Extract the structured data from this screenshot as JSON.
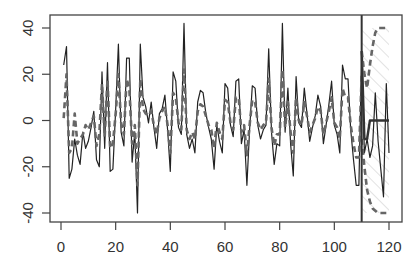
{
  "chart_data": {
    "type": "line",
    "title": "",
    "xlabel": "",
    "ylabel": "",
    "xlim": [
      -3,
      125
    ],
    "ylim": [
      -44,
      46
    ],
    "grid": false,
    "legend": null,
    "x_ticks": [
      0,
      20,
      40,
      60,
      80,
      100,
      120
    ],
    "y_ticks": [
      -40,
      -20,
      0,
      20,
      40
    ],
    "x_tick_labels": [
      "0",
      "20",
      "40",
      "60",
      "80",
      "100",
      "120"
    ],
    "y_tick_labels": [
      "-40",
      "-20",
      "0",
      "20",
      "40"
    ],
    "forecast_start": 110,
    "series": [
      {
        "name": "observed",
        "style": "solid",
        "color": "#222222",
        "x": [
          1,
          2,
          3,
          4,
          5,
          6,
          7,
          8,
          9,
          10,
          11,
          12,
          13,
          14,
          15,
          16,
          17,
          18,
          19,
          20,
          21,
          22,
          23,
          24,
          25,
          26,
          27,
          28,
          29,
          30,
          31,
          32,
          33,
          34,
          35,
          36,
          37,
          38,
          39,
          40,
          41,
          42,
          43,
          44,
          45,
          46,
          47,
          48,
          49,
          50,
          51,
          52,
          53,
          54,
          55,
          56,
          57,
          58,
          59,
          60,
          61,
          62,
          63,
          64,
          65,
          66,
          67,
          68,
          69,
          70,
          71,
          72,
          73,
          74,
          75,
          76,
          77,
          78,
          79,
          80,
          81,
          82,
          83,
          84,
          85,
          86,
          87,
          88,
          89,
          90,
          91,
          92,
          93,
          94,
          95,
          96,
          97,
          98,
          99,
          100,
          101,
          102,
          103,
          104,
          105,
          106,
          107,
          108,
          109,
          110,
          111,
          112,
          113,
          114,
          115,
          116,
          117,
          118,
          119,
          120
        ],
        "values": [
          24,
          32,
          -25,
          -21,
          -8,
          -15,
          -19,
          -5,
          -12,
          -9,
          -3,
          4,
          -17,
          -20,
          21,
          -12,
          25,
          -22,
          -21,
          5,
          33,
          -5,
          -11,
          27,
          27,
          -18,
          -5,
          -40,
          33,
          10,
          6,
          -1,
          8,
          -3,
          -12,
          3,
          5,
          11,
          -4,
          -22,
          21,
          17,
          -3,
          -6,
          42,
          -6,
          -12,
          -8,
          -14,
          8,
          13,
          12,
          3,
          -3,
          -8,
          -21,
          -2,
          -9,
          -14,
          16,
          14,
          -2,
          -7,
          17,
          18,
          -10,
          -4,
          -28,
          -4,
          15,
          14,
          -2,
          -8,
          -4,
          -2,
          31,
          -5,
          -19,
          -10,
          -11,
          42,
          -5,
          14,
          -10,
          -24,
          19,
          -1,
          -3,
          14,
          3,
          -9,
          -3,
          2,
          11,
          6,
          -10,
          -2,
          7,
          17,
          -2,
          -6,
          -14,
          24,
          18,
          18,
          -4,
          -17,
          -28,
          -28,
          30,
          -14,
          -8,
          -16,
          -11,
          12,
          -9,
          -21,
          -33,
          16,
          -14
        ]
      },
      {
        "name": "fitted",
        "style": "dashed",
        "color": "#666666",
        "x": [
          1,
          2,
          3,
          4,
          5,
          6,
          7,
          8,
          9,
          10,
          11,
          12,
          13,
          14,
          15,
          16,
          17,
          18,
          19,
          20,
          21,
          22,
          23,
          24,
          25,
          26,
          27,
          28,
          29,
          30,
          31,
          32,
          33,
          34,
          35,
          36,
          37,
          38,
          39,
          40,
          41,
          42,
          43,
          44,
          45,
          46,
          47,
          48,
          49,
          50,
          51,
          52,
          53,
          54,
          55,
          56,
          57,
          58,
          59,
          60,
          61,
          62,
          63,
          64,
          65,
          66,
          67,
          68,
          69,
          70,
          71,
          72,
          73,
          74,
          75,
          76,
          77,
          78,
          79,
          80,
          81,
          82,
          83,
          84,
          85,
          86,
          87,
          88,
          89,
          90,
          91,
          92,
          93,
          94,
          95,
          96,
          97,
          98,
          99,
          100,
          101,
          102,
          103,
          104,
          105,
          106,
          107,
          108,
          109,
          110
        ],
        "values": [
          1,
          20,
          -14,
          -12,
          3,
          -10,
          -8,
          -6,
          -2,
          -4,
          -1,
          2,
          -11,
          -6,
          16,
          -7,
          18,
          -12,
          -10,
          3,
          20,
          -1,
          -6,
          18,
          14,
          -10,
          -2,
          -28,
          18,
          5,
          3,
          2,
          4,
          -2,
          -6,
          1,
          4,
          6,
          -2,
          -14,
          12,
          10,
          -1,
          -4,
          22,
          -4,
          -8,
          -5,
          -8,
          4,
          7,
          6,
          2,
          -2,
          -4,
          -12,
          -1,
          -5,
          -8,
          9,
          8,
          -1,
          -4,
          10,
          10,
          -5,
          -2,
          -15,
          -2,
          9,
          8,
          -1,
          -4,
          -2,
          -1,
          18,
          -3,
          -11,
          -6,
          -6,
          22,
          -3,
          8,
          -5,
          -14,
          10,
          0,
          -2,
          8,
          2,
          -5,
          -2,
          1,
          6,
          4,
          -6,
          -1,
          4,
          10,
          -1,
          -3,
          -8,
          14,
          10,
          10,
          -2,
          -10,
          -16,
          -16,
          20
        ]
      },
      {
        "name": "forecast",
        "style": "solid-thick",
        "color": "#333333",
        "x": [
          110,
          111,
          112,
          113,
          114,
          115,
          116,
          117,
          118,
          119,
          120
        ],
        "values": [
          30,
          -8,
          -8,
          0,
          0,
          0,
          0,
          0,
          0,
          0,
          0
        ]
      },
      {
        "name": "upper_bound",
        "style": "dashed",
        "color": "#666666",
        "x": [
          110,
          111,
          112,
          113,
          114,
          115,
          116,
          117,
          118,
          119
        ],
        "values": [
          30,
          20,
          14,
          24,
          32,
          38,
          40,
          40,
          40,
          40
        ]
      },
      {
        "name": "lower_bound",
        "style": "dashed",
        "color": "#666666",
        "x": [
          110,
          111,
          112,
          113,
          114,
          115,
          116,
          117,
          118,
          119
        ],
        "values": [
          -8,
          -20,
          -30,
          -35,
          -38,
          -39,
          -40,
          -40,
          -40,
          -40
        ]
      }
    ],
    "shaded_region": {
      "x_start": 110,
      "x_end": 120,
      "y_low": -40,
      "y_high": 40,
      "pattern": "diagonal-hatch",
      "color": "#cccccc"
    }
  },
  "colors": {
    "axis": "#444444",
    "observed": "#222222",
    "fitted": "#666666",
    "hatch": "#cccccc",
    "vline": "#333333"
  }
}
